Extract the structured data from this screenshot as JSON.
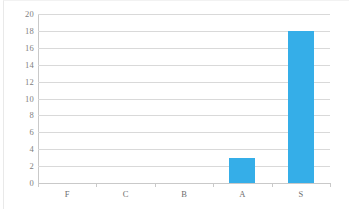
{
  "chart_data": {
    "type": "bar",
    "title": "",
    "subtitle": "",
    "xlabel": "",
    "ylabel": "",
    "categories": [
      "F",
      "C",
      "B",
      "A",
      "S"
    ],
    "values": [
      0,
      0,
      0,
      3,
      18
    ],
    "series": [
      {
        "name": "",
        "values": [
          0,
          0,
          0,
          3,
          18
        ]
      }
    ],
    "ylim": [
      0,
      20
    ],
    "ytick_step": 2,
    "yticks": [
      0,
      2,
      4,
      6,
      8,
      10,
      12,
      14,
      16,
      18,
      20
    ],
    "ytick_labels": [
      "0",
      "2",
      "4",
      "6",
      "8",
      "10",
      "12",
      "14",
      "16",
      "18",
      "20"
    ],
    "grid": true,
    "grid_axis": "y",
    "legend": false,
    "legend_position": "none",
    "annotations": []
  },
  "style": {
    "bar_color": "#35aee8",
    "gridline_color": "#d9d9d9",
    "axis_color": "#c9c9c9",
    "ytick_label_color": "#808080",
    "xtick_label_color": "#6e6e6e",
    "background_color": "#ffffff"
  }
}
